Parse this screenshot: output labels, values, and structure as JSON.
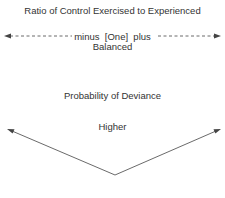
{
  "diagram": {
    "title": "Ratio of Control Exercised to Experienced",
    "ratio_scale": {
      "left_label": "minus",
      "center_label": "[One]",
      "right_label": "plus",
      "balanced_label": "Balanced",
      "left_arrow": "arrow-left",
      "right_arrow": "arrow-right",
      "line_style": "dashed"
    },
    "deviance": {
      "title": "Probability of Deviance",
      "higher_label": "Higher",
      "shape": "V-shaped arrows pointing up-left and up-right"
    },
    "colors": {
      "text": "#333333",
      "lines": "#444444",
      "background": "#ffffff"
    }
  }
}
